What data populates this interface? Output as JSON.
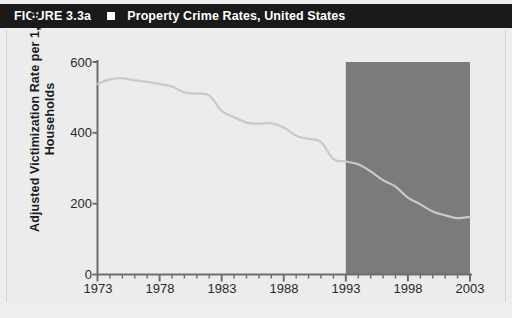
{
  "figure": {
    "number": "FIGURE 3.3a",
    "bullet_icon": "square-bullet-icon",
    "title": "Property Crime Rates, United States"
  },
  "chart_data": {
    "type": "line",
    "title": "Property Crime Rates, United States",
    "xlabel": "",
    "ylabel": "Adjusted Victimization Rate per 1,000 Households",
    "xlim": [
      1973,
      2003
    ],
    "ylim": [
      0,
      600
    ],
    "grid": false,
    "legend": "none",
    "line_color": "#c9c9c9",
    "axis_color": "#6e6e6e",
    "background_color": "#ececec",
    "x_major_ticks": [
      1973,
      1978,
      1983,
      1988,
      1993,
      1998,
      2003
    ],
    "x_tick_labels": [
      "1973",
      "1978",
      "1983",
      "1988",
      "1993",
      "1998",
      "2003"
    ],
    "x_minor_tick_interval": 1,
    "y_ticks": [
      0,
      200,
      400,
      600
    ],
    "y_tick_labels": [
      "0",
      "200",
      "400",
      "600"
    ],
    "shaded_region": {
      "label": "highlight-band",
      "x_start": 1993,
      "x_end": 2003,
      "y_start": 0,
      "y_end": 600,
      "color": "#7b7b7b"
    },
    "x": [
      1973,
      1974,
      1975,
      1976,
      1977,
      1978,
      1979,
      1980,
      1981,
      1982,
      1983,
      1984,
      1985,
      1986,
      1987,
      1988,
      1989,
      1990,
      1991,
      1992,
      1993,
      1994,
      1995,
      1996,
      1997,
      1998,
      1999,
      2000,
      2001,
      2002,
      2003
    ],
    "values": [
      538,
      551,
      554,
      548,
      544,
      538,
      531,
      514,
      511,
      506,
      462,
      444,
      429,
      426,
      427,
      415,
      392,
      383,
      374,
      326,
      319,
      311,
      291,
      266,
      248,
      217,
      198,
      178,
      167,
      159,
      163
    ],
    "series": [
      {
        "name": "Property crime victimization rate",
        "values": [
          538,
          551,
          554,
          548,
          544,
          538,
          531,
          514,
          511,
          506,
          462,
          444,
          429,
          426,
          427,
          415,
          392,
          383,
          374,
          326,
          319,
          311,
          291,
          266,
          248,
          217,
          198,
          178,
          167,
          159,
          163
        ]
      }
    ]
  }
}
